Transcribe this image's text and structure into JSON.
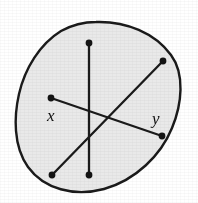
{
  "figure": {
    "caption": "",
    "background_color": "#ffffff",
    "region": {
      "name": "closed-blob-region",
      "fill_color": "#e9e9e9",
      "stroke_color": "#1a1a1a",
      "stroke_width": 2.4,
      "path": "M 96 22 C 126 21 155 33 171 55 C 185 74 182 104 172 128 C 161 155 136 180 104 189 C 74 197 44 189 28 167 C 13 146 14 116 19 94 C 25 68 40 44 61 31 C 72 25 84 22 96 22 Z"
    },
    "segments": [
      {
        "name": "vertical-segment",
        "x1": 89,
        "y1": 43,
        "x2": 89,
        "y2": 175,
        "stroke_color": "#1a1a1a",
        "stroke_width": 2.3
      },
      {
        "name": "diagonal-segment-up-right",
        "x1": 52,
        "y1": 175,
        "x2": 163,
        "y2": 61,
        "stroke_color": "#1a1a1a",
        "stroke_width": 2.3
      },
      {
        "name": "xy-segment",
        "x1": 51,
        "y1": 98,
        "x2": 162,
        "y2": 136,
        "stroke_color": "#1a1a1a",
        "stroke_width": 2.3
      }
    ],
    "endpoints": [
      {
        "name": "endpoint-vertical-top",
        "cx": 89,
        "cy": 43,
        "r": 3.4,
        "color": "#141414"
      },
      {
        "name": "endpoint-vertical-bottom",
        "cx": 89,
        "cy": 175,
        "r": 3.4,
        "color": "#141414"
      },
      {
        "name": "endpoint-diagonal-top-right",
        "cx": 163,
        "cy": 61,
        "r": 3.4,
        "color": "#141414"
      },
      {
        "name": "endpoint-diagonal-bottom-left",
        "cx": 52,
        "cy": 175,
        "r": 3.4,
        "color": "#141414"
      },
      {
        "name": "endpoint-x",
        "cx": 51,
        "cy": 98,
        "r": 3.4,
        "color": "#141414"
      },
      {
        "name": "endpoint-y",
        "cx": 162,
        "cy": 136,
        "r": 3.4,
        "color": "#141414"
      }
    ],
    "labels": [
      {
        "name": "label-x",
        "text": "x",
        "x": 47,
        "y": 121,
        "font_size": 17,
        "style": "italic",
        "color": "#101010"
      },
      {
        "name": "label-y",
        "text": "y",
        "x": 152,
        "y": 124,
        "font_size": 17,
        "style": "italic",
        "color": "#101010"
      }
    ]
  }
}
